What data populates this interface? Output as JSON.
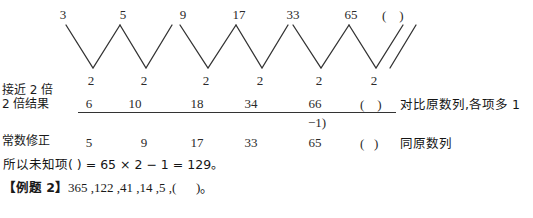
{
  "sequence_row": {
    "label": "original-sequence",
    "terms": [
      "3",
      "5",
      "9",
      "17",
      "33",
      "65"
    ],
    "unknown": "(    )"
  },
  "diff_row": {
    "values": [
      "2",
      "2",
      "2",
      "2",
      "2",
      "2"
    ]
  },
  "left_labels": {
    "line1": "接近 2 倍",
    "line2": "2 倍结果",
    "line3": "常数修正"
  },
  "doubled_row": {
    "values": [
      "6",
      "10",
      "18",
      "34",
      "66"
    ],
    "unknown": "(    )",
    "note": "对比原数列,各项多 1"
  },
  "minus_one": {
    "text": "−1)"
  },
  "corrected_row": {
    "values": [
      "5",
      "9",
      "17",
      "33",
      "65"
    ],
    "unknown": "(   )",
    "note": "同原数列"
  },
  "conclusion": {
    "text": "所以未知项(        ) = 65 × 2 − 1 = 129。"
  },
  "example2": {
    "tag": "【例题 2】",
    "sequence": "365 ,122 ,41 ,14 ,5 ,(      )。"
  },
  "options": [
    {
      "key": "A.",
      "value": "1"
    },
    {
      "key": "B.",
      "value": "2"
    },
    {
      "key": "C.",
      "value": "3"
    },
    {
      "key": "D.",
      "value": "4"
    }
  ],
  "colors": {
    "ink": "#1a1a1a",
    "rule": "#333333",
    "page_bg": "#ffffff"
  }
}
